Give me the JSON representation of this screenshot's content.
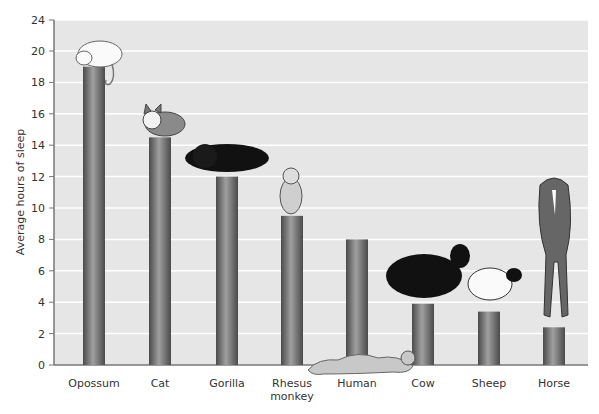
{
  "chart_data": {
    "type": "bar",
    "title": "",
    "xlabel": "",
    "ylabel": "Average hours of sleep",
    "categories": [
      "Opossum",
      "Cat",
      "Gorilla",
      "Rhesus monkey",
      "Human",
      "Cow",
      "Sheep",
      "Horse"
    ],
    "category_lines": [
      [
        "Opossum"
      ],
      [
        "Cat"
      ],
      [
        "Gorilla"
      ],
      [
        "Rhesus",
        "monkey"
      ],
      [
        "Human"
      ],
      [
        "Cow"
      ],
      [
        "Sheep"
      ],
      [
        "Horse"
      ]
    ],
    "values": [
      19,
      14.5,
      12,
      9.5,
      8,
      3.9,
      3.4,
      2.4
    ],
    "yticks": [
      0,
      2,
      4,
      6,
      8,
      10,
      12,
      14,
      16,
      18,
      20,
      24
    ],
    "ylim": [
      0,
      24
    ],
    "axis_break": "between 20 and 24",
    "grid": true,
    "legend": null,
    "illustrations": [
      "opossum",
      "cat",
      "gorilla",
      "rhesus-monkey",
      "human",
      "cow",
      "sheep",
      "horse"
    ]
  },
  "colors": {
    "plot_bg": "#e6e6e6",
    "gridline": "#ffffff",
    "bar_dark": "#555555",
    "bar_light": "#9a9a9a",
    "axis": "#777777",
    "text": "#333333"
  }
}
